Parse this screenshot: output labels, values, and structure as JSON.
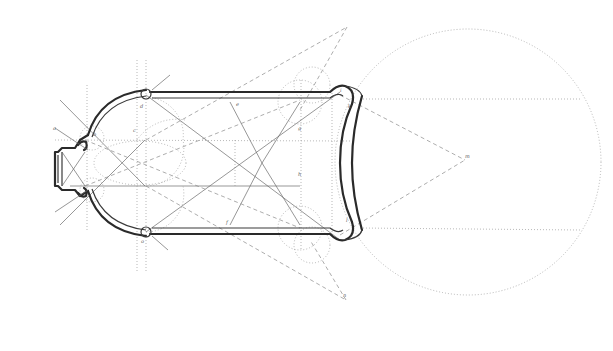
{
  "figure": {
    "type": "geometric construction drawing",
    "colors": {
      "background": "#ffffff",
      "outline": "#2a2a2a",
      "construction": "#8a8a8a"
    },
    "labels": {
      "l1": "a",
      "l2": "b",
      "l3": "c",
      "l4": "d",
      "l5": "e",
      "l6": "f",
      "l7": "g",
      "l8": "h",
      "l9": "i",
      "l10": "k",
      "l11": "l",
      "l12": "m",
      "l13": "n",
      "l14": "o"
    }
  }
}
